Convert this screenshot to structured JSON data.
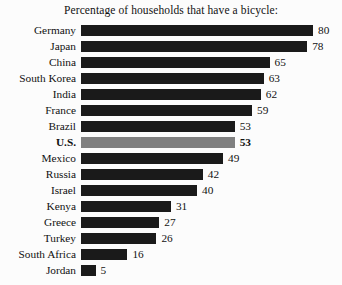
{
  "chart_data": {
    "type": "bar",
    "orientation": "horizontal",
    "title": "Percentage of households that have a bicycle:",
    "xlabel": "",
    "ylabel": "",
    "xlim": [
      0,
      80
    ],
    "grid": false,
    "legend": null,
    "value_labels": true,
    "categories": [
      "Germany",
      "Japan",
      "China",
      "South Korea",
      "India",
      "France",
      "Brazil",
      "U.S.",
      "Mexico",
      "Russia",
      "Israel",
      "Kenya",
      "Greece",
      "Turkey",
      "South Africa",
      "Jordan"
    ],
    "values": [
      80,
      78,
      65,
      63,
      62,
      59,
      53,
      53,
      49,
      42,
      40,
      31,
      27,
      26,
      16,
      5
    ],
    "highlight_category": "U.S.",
    "colors": {
      "bar": "#1a1a1a",
      "bar_highlight": "#808080",
      "text": "#111111",
      "background": "#fcfcfc"
    }
  },
  "rows": [
    {
      "label": "Germany",
      "value": "80",
      "pct": 80,
      "highlight": false
    },
    {
      "label": "Japan",
      "value": "78",
      "pct": 78,
      "highlight": false
    },
    {
      "label": "China",
      "value": "65",
      "pct": 65,
      "highlight": false
    },
    {
      "label": "South Korea",
      "value": "63",
      "pct": 63,
      "highlight": false
    },
    {
      "label": "India",
      "value": "62",
      "pct": 62,
      "highlight": false
    },
    {
      "label": "France",
      "value": "59",
      "pct": 59,
      "highlight": false
    },
    {
      "label": "Brazil",
      "value": "53",
      "pct": 53,
      "highlight": false
    },
    {
      "label": "U.S.",
      "value": "53",
      "pct": 53,
      "highlight": true
    },
    {
      "label": "Mexico",
      "value": "49",
      "pct": 49,
      "highlight": false
    },
    {
      "label": "Russia",
      "value": "42",
      "pct": 42,
      "highlight": false
    },
    {
      "label": "Israel",
      "value": "40",
      "pct": 40,
      "highlight": false
    },
    {
      "label": "Kenya",
      "value": "31",
      "pct": 31,
      "highlight": false
    },
    {
      "label": "Greece",
      "value": "27",
      "pct": 27,
      "highlight": false
    },
    {
      "label": "Turkey",
      "value": "26",
      "pct": 26,
      "highlight": false
    },
    {
      "label": "South Africa",
      "value": "16",
      "pct": 16,
      "highlight": false
    },
    {
      "label": "Jordan",
      "value": "5",
      "pct": 5,
      "highlight": false
    }
  ]
}
